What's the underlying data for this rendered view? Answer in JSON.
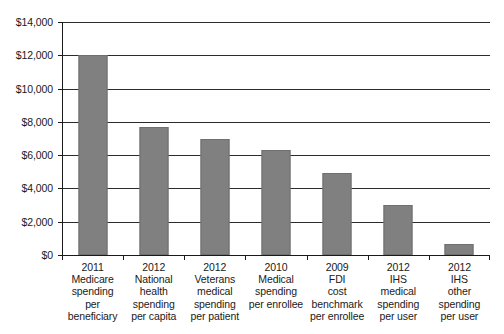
{
  "chart_data": {
    "type": "bar",
    "title": "",
    "subtitle": "",
    "xlabel": "",
    "ylabel": "",
    "ylim": [
      0,
      14000
    ],
    "ytick_interval": 2000,
    "grid": true,
    "legend": false,
    "bar_color": "#808080",
    "axis_color": "#1a1a1a",
    "background_color": "#ffffff",
    "categories": [
      "2011\nMedicare\nspending\nper\nbeneficiary",
      "2012\nNational\nhealth\nspending\nper capita",
      "2012\nVeterans\nmedical\nspending\nper patient",
      "2010\nMedical\nspending\nper enrollee",
      "2009\nFDI\ncost\nbenchmark\nper enrollee",
      "2012\nIHS\nmedical\nspending\nper user",
      "2012\nIHS\nother\nspending\nper user"
    ],
    "values": [
      12000,
      7700,
      7000,
      6300,
      4900,
      3000,
      650
    ],
    "ytick_labels": [
      "$0",
      "$2,000",
      "$4,000",
      "$6,000",
      "$8,000",
      "$10,000",
      "$12,000",
      "$14,000"
    ],
    "ytick_values": [
      0,
      2000,
      4000,
      6000,
      8000,
      10000,
      12000,
      14000
    ]
  }
}
